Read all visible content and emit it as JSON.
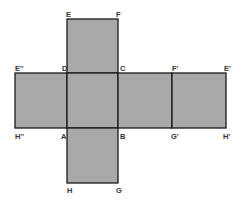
{
  "diagram": {
    "type": "cube-net",
    "colors": {
      "face_fill": "#a9a9a9",
      "edge": "#1a1a1a",
      "label": "#333333",
      "background": "#ffffff"
    },
    "faces": [
      {
        "id": "top",
        "x": 67,
        "y": 19,
        "w": 51,
        "h": 54,
        "corners": [
          "E",
          "F",
          "C",
          "D"
        ]
      },
      {
        "id": "left-far",
        "x": 15,
        "y": 73,
        "w": 52,
        "h": 55,
        "corners": [
          "E''",
          "D",
          "A",
          "H''"
        ]
      },
      {
        "id": "center",
        "x": 67,
        "y": 73,
        "w": 51,
        "h": 55,
        "corners": [
          "D",
          "C",
          "B",
          "A"
        ]
      },
      {
        "id": "right",
        "x": 118,
        "y": 73,
        "w": 54,
        "h": 55,
        "corners": [
          "C",
          "F'",
          "G'",
          "B"
        ]
      },
      {
        "id": "right-far",
        "x": 172,
        "y": 73,
        "w": 54,
        "h": 55,
        "corners": [
          "F'",
          "E'",
          "H'",
          "G'"
        ]
      },
      {
        "id": "bottom",
        "x": 67,
        "y": 128,
        "w": 51,
        "h": 55,
        "corners": [
          "A",
          "B",
          "G",
          "H"
        ]
      }
    ],
    "labels": {
      "E": "E",
      "F": "F",
      "E2": "E''",
      "D": "D",
      "C": "C",
      "F1": "F'",
      "E1": "E'",
      "H2": "H''",
      "A": "A",
      "B": "B",
      "G1": "G'",
      "H1": "H'",
      "H": "H",
      "G": "G"
    }
  }
}
